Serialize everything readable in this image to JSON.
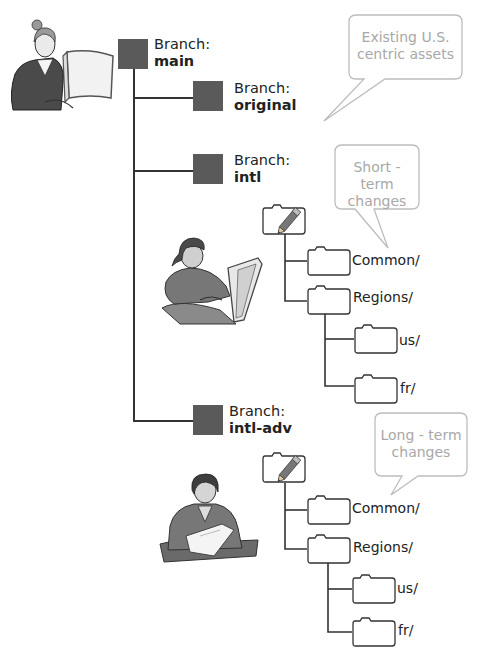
{
  "branches": [
    {
      "prefix": "Branch:",
      "name": "main"
    },
    {
      "prefix": "Branch:",
      "name": "original"
    },
    {
      "prefix": "Branch:",
      "name": "intl"
    },
    {
      "prefix": "Branch:",
      "name": "intl-adv"
    }
  ],
  "bubbles": [
    {
      "line1": "Existing U.S.",
      "line2": "centric assets"
    },
    {
      "line1": "Short - term",
      "line2": "changes"
    },
    {
      "line1": "Long - term",
      "line2": "changes"
    }
  ],
  "trees": [
    {
      "folders": [
        "Common/",
        "Regions/",
        "us/",
        "fr/"
      ]
    },
    {
      "folders": [
        "Common/",
        "Regions/",
        "us/",
        "fr/"
      ]
    }
  ],
  "colors": {
    "branch_box": "#5a5a5a",
    "line": "#333333",
    "bubble_border": "#bdbdbd",
    "bubble_text": "#a8a8a8"
  }
}
